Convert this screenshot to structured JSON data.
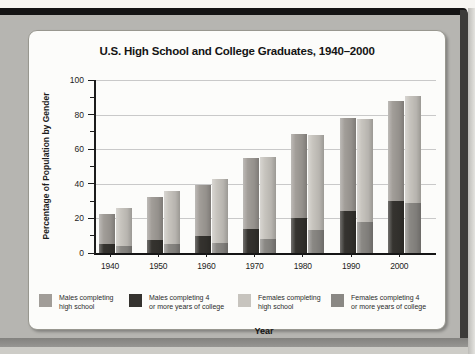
{
  "chart_data": {
    "type": "bar",
    "title": "U.S. High School and College Graduates, 1940–2000",
    "xlabel": "Year",
    "ylabel": "Percentage of Population by Gender",
    "ylim": [
      0,
      100
    ],
    "yticks": [
      0,
      20,
      40,
      60,
      80,
      100
    ],
    "yticks_minor": [
      10,
      30,
      50,
      70,
      90
    ],
    "grid": "horizontal",
    "legend_position": "bottom",
    "categories": [
      "1940",
      "1950",
      "1960",
      "1970",
      "1980",
      "1990",
      "2000"
    ],
    "series": [
      {
        "key": "males-hs",
        "name": "Males completing high school",
        "color": "#a19d98",
        "values": [
          22.5,
          32.5,
          39.5,
          55,
          69,
          78,
          88
        ]
      },
      {
        "key": "males-college",
        "name": "Males completing 4 or more years of college",
        "color": "#35332f",
        "values": [
          5.5,
          7.5,
          10,
          14,
          20.5,
          24.5,
          30
        ]
      },
      {
        "key": "females-hs",
        "name": "Females completing high school",
        "color": "#c7c4be",
        "values": [
          26,
          36,
          42.5,
          55.5,
          68,
          77.5,
          91
        ]
      },
      {
        "key": "females-college",
        "name": "Females completing 4 or more years of college",
        "color": "#8a8884",
        "values": [
          4,
          5,
          6,
          8,
          13.5,
          18,
          29
        ]
      }
    ],
    "legend_items": [
      {
        "line1": "Males completing",
        "line2": "high school"
      },
      {
        "line1": "Males completing 4",
        "line2": "or more years of college"
      },
      {
        "line1": "Females completing",
        "line2": "high school"
      },
      {
        "line1": "Females completing 4",
        "line2": "or more years of college"
      }
    ]
  }
}
